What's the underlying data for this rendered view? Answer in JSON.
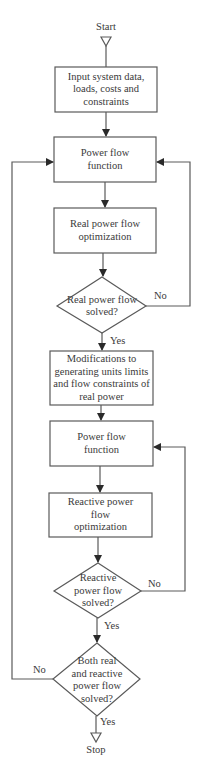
{
  "diagram": {
    "type": "flowchart",
    "colors": {
      "stroke": "#5a5a5a",
      "text": "#3a3a3a",
      "background": "#ffffff"
    },
    "start": "Start",
    "stop": "Stop",
    "nodes": [
      {
        "id": "input",
        "shape": "rect",
        "text": "Input system data,\nloads, costs and\nconstraints"
      },
      {
        "id": "pf1",
        "shape": "rect",
        "text": "Power flow\nfunction"
      },
      {
        "id": "rpo",
        "shape": "rect",
        "text": "Real power flow\noptimization"
      },
      {
        "id": "d1",
        "shape": "diamond",
        "text": "Real power flow\nsolved?"
      },
      {
        "id": "mod",
        "shape": "rect",
        "text": "Modifications to\ngenerating units limits\nand flow constraints of\nreal power"
      },
      {
        "id": "pf2",
        "shape": "rect",
        "text": "Power flow\nfunction"
      },
      {
        "id": "qpo",
        "shape": "rect",
        "text": "Reactive power\nflow\noptimization"
      },
      {
        "id": "d2",
        "shape": "diamond",
        "text": "Reactive\npower flow\nsolved?"
      },
      {
        "id": "d3",
        "shape": "diamond",
        "text": "Both real\nand reactive\npower flow\nsolved?"
      }
    ],
    "edge_labels": {
      "d1_no": "No",
      "d1_yes": "Yes",
      "d2_no": "No",
      "d2_yes": "Yes",
      "d3_no": "No",
      "d3_yes": "Yes"
    }
  }
}
